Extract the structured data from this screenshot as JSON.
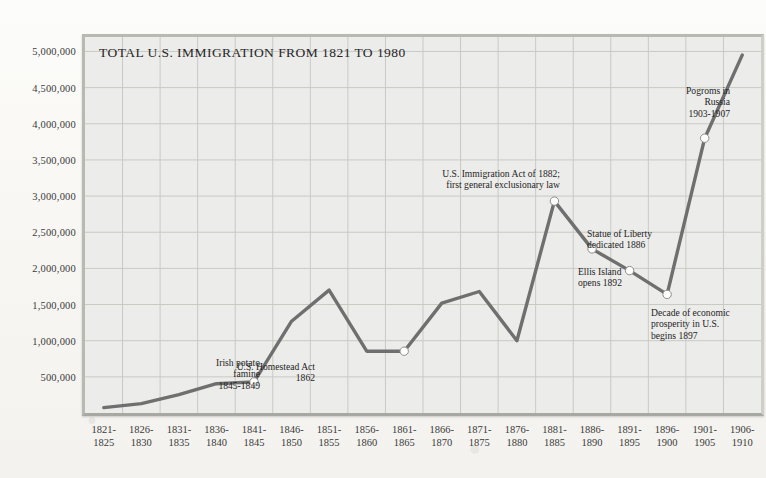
{
  "chart_data": {
    "type": "line",
    "title": "TOTAL U.S. IMMIGRATION FROM 1821 TO 1980",
    "xlabel": "",
    "ylabel": "",
    "grid": true,
    "legend": "none",
    "ylim": [
      0,
      5200000
    ],
    "ytick_labels": [
      "5,000,000",
      "4,500,000",
      "4,000,000",
      "3,500,000",
      "3,000,000",
      "2,500,000",
      "2,000,000",
      "1,500,000",
      "1,000,000",
      "500,000"
    ],
    "ytick_values": [
      5000000,
      4500000,
      4000000,
      3500000,
      3000000,
      2500000,
      2000000,
      1500000,
      1000000,
      500000
    ],
    "categories": [
      "1821-\n1825",
      "1826-\n1830",
      "1831-\n1835",
      "1836-\n1840",
      "1841-\n1845",
      "1846-\n1850",
      "1851-\n1855",
      "1856-\n1860",
      "1861-\n1865",
      "1866-\n1870",
      "1871-\n1875",
      "1876-\n1880",
      "1881-\n1885",
      "1886-\n1890",
      "1891-\n1895",
      "1896-\n1900",
      "1901-\n1905",
      "1906-\n1910"
    ],
    "values": [
      75000,
      130000,
      255000,
      405000,
      430000,
      1270000,
      1700000,
      855000,
      855000,
      1520000,
      1680000,
      1000000,
      2930000,
      2270000,
      1970000,
      1640000,
      3800000,
      4950000
    ],
    "markers": [
      {
        "index": 4,
        "label": "Irish potato famine 1845-1849"
      },
      {
        "index": 8,
        "label": "U.S. Homestead Act 1862"
      },
      {
        "index": 12,
        "label": "U.S. Immigration Act of 1882; first general exclusionary law"
      },
      {
        "index": 13,
        "label": "Statue of Liberty dedicated 1886"
      },
      {
        "index": 14,
        "label": "Ellis Island opens 1892"
      },
      {
        "index": 15,
        "label": "Decade of economic prosperity in U.S. begins 1897"
      },
      {
        "index": 16,
        "label": "Pogroms in Russia 1903-1907"
      }
    ],
    "annotations": [
      {
        "name": "irish-potato-famine",
        "lines": [
          "Irish potato",
          "famine",
          "1845-1849"
        ]
      },
      {
        "name": "us-homestead-act",
        "lines": [
          "U.S. Homestead Act",
          "1862"
        ]
      },
      {
        "name": "immigration-act-1882",
        "lines": [
          "U.S. Immigration Act of 1882;",
          "first general exclusionary law"
        ]
      },
      {
        "name": "statue-of-liberty",
        "lines": [
          "Statue of Liberty",
          "dedicated 1886"
        ]
      },
      {
        "name": "ellis-island",
        "lines": [
          "Ellis Island",
          "opens 1892"
        ]
      },
      {
        "name": "economic-prosperity",
        "lines": [
          "Decade of economic",
          "prosperity in U.S.",
          "begins 1897"
        ]
      },
      {
        "name": "pogroms-in-russia",
        "lines": [
          "Pogroms in",
          "Russia",
          "1903-1907"
        ]
      }
    ],
    "colors": {
      "line": "#6f6f6f",
      "plot_background": "#ececea",
      "grid": "#c9c9c4",
      "frame": "#b9b9b4",
      "marker_fill": "#ffffff",
      "text": "#262626",
      "page_background": "#f7f6f2"
    }
  }
}
